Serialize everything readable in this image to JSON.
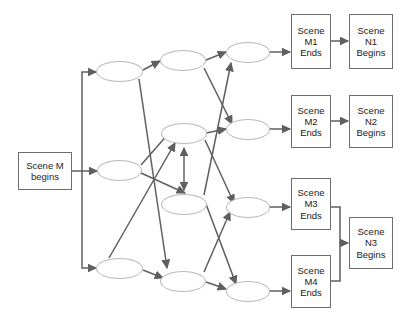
{
  "diagram": {
    "colors": {
      "box_border": "#6d6d6d",
      "ellipse_border": "#b9b9b9",
      "arrow": "#5f5f5f",
      "background": "#ffffff",
      "text": "#1a1a1a"
    },
    "start_node": {
      "id": "scene-m-begins",
      "line1": "Scene M",
      "line2": "begins"
    },
    "end_nodes": [
      {
        "id": "scene-m1-ends",
        "line1": "Scene",
        "line2": "M1",
        "line3": "Ends"
      },
      {
        "id": "scene-m2-ends",
        "line1": "Scene",
        "line2": "M2",
        "line3": "Ends"
      },
      {
        "id": "scene-m3-ends",
        "line1": "Scene",
        "line2": "M3",
        "line3": "Ends"
      },
      {
        "id": "scene-m4-ends",
        "line1": "Scene",
        "line2": "M4",
        "line3": "Ends"
      }
    ],
    "begin_nodes": [
      {
        "id": "scene-n1-begins",
        "line1": "Scene",
        "line2": "N1",
        "line3": "Begins"
      },
      {
        "id": "scene-n2-begins",
        "line1": "Scene",
        "line2": "N2",
        "line3": "Begins"
      },
      {
        "id": "scene-n3-begins",
        "line1": "Scene",
        "line2": "N3",
        "line3": "Begins"
      }
    ],
    "intermediate_nodes": [
      {
        "id": "node-c1-r1",
        "column": 1,
        "row": 1
      },
      {
        "id": "node-c1-r2",
        "column": 1,
        "row": 2
      },
      {
        "id": "node-c1-r4",
        "column": 1,
        "row": 4
      },
      {
        "id": "node-c2-r1",
        "column": 2,
        "row": 1
      },
      {
        "id": "node-c2-r2",
        "column": 2,
        "row": 2
      },
      {
        "id": "node-c2-r3",
        "column": 2,
        "row": 3
      },
      {
        "id": "node-c2-r4",
        "column": 2,
        "row": 4
      },
      {
        "id": "node-c3-r1",
        "column": 3,
        "row": 1
      },
      {
        "id": "node-c3-r2",
        "column": 3,
        "row": 2
      },
      {
        "id": "node-c3-r3",
        "column": 3,
        "row": 3
      },
      {
        "id": "node-c3-r4",
        "column": 3,
        "row": 4
      }
    ]
  }
}
